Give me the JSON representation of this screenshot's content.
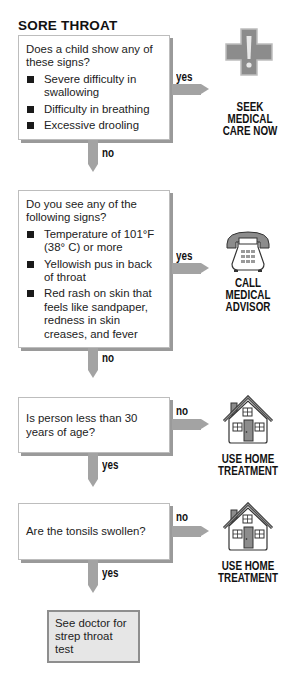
{
  "title": "SORE THROAT",
  "colors": {
    "arrow": "#a3a3a3",
    "box_shadow": "#9a9a9a",
    "final_box_fill": "#e6e6e6",
    "icon_gray": "#8c8c8c"
  },
  "steps": [
    {
      "question": "Does a child show any of these signs?",
      "bullets": [
        "Severe difficulty in swallowing",
        "Difficulty in breathing",
        "Excessive drooling"
      ],
      "side_label": "yes",
      "down_label": "no",
      "outcome": {
        "icon": "medical-cross-icon",
        "lines": [
          "SEEK",
          "MEDICAL",
          "CARE NOW"
        ]
      }
    },
    {
      "question": "Do you see any of the following signs?",
      "bullets": [
        "Temperature of 101°F (38° C) or more",
        "Yellowish pus in back of throat",
        "Red rash on skin that feels like sandpaper, redness in skin creases, and fever"
      ],
      "side_label": "yes",
      "down_label": "no",
      "outcome": {
        "icon": "telephone-icon",
        "lines": [
          "CALL",
          "MEDICAL",
          "ADVISOR"
        ]
      }
    },
    {
      "question": "Is person less than 30 years of age?",
      "side_label": "no",
      "down_label": "yes",
      "outcome": {
        "icon": "house-icon",
        "lines": [
          "USE HOME",
          "TREATMENT"
        ]
      }
    },
    {
      "question": "Are the tonsils swollen?",
      "side_label": "no",
      "down_label": "yes",
      "outcome": {
        "icon": "house-icon",
        "lines": [
          "USE HOME",
          "TREATMENT"
        ]
      }
    }
  ],
  "final": "See doctor for strep throat test"
}
